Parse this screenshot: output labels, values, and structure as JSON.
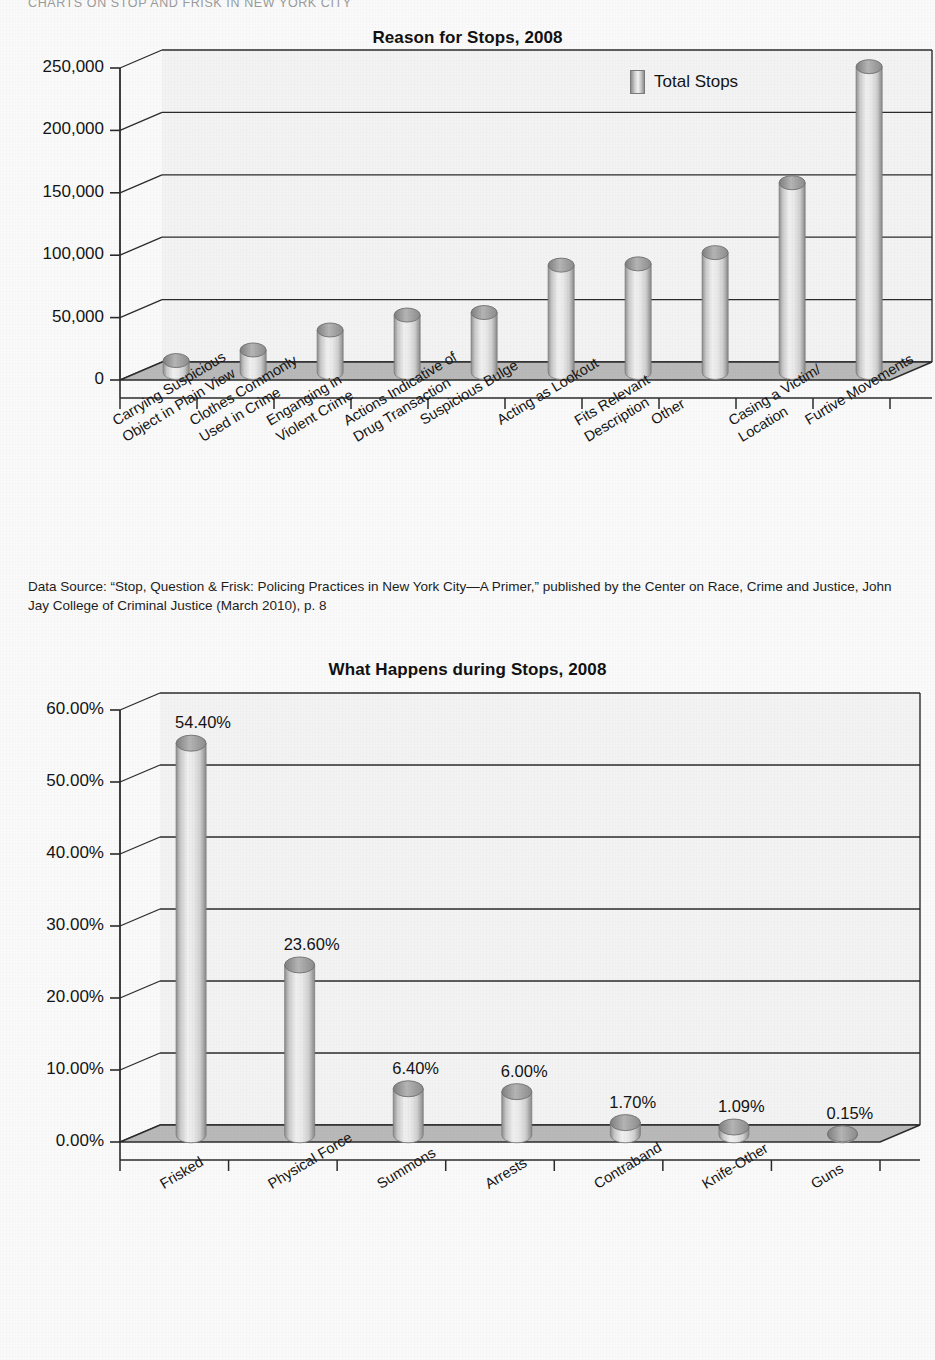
{
  "running_header": "CHARTS ON STOP AND FRISK IN NEW YORK CITY",
  "caption": {
    "text": "Data Source: “Stop, Question & Frisk: Policing Practices in New York City—A Primer,” published by the Center on Race, Crime and Justice, John Jay College of Criminal Justice (March 2010), p. 8"
  },
  "colors": {
    "bar_light": "#f0f0f0",
    "bar_mid": "#cfcfcf",
    "bar_dark": "#8f8f8f",
    "bar_top": "#a8a8a8",
    "floor": "#b9b9b9",
    "axis": "#2b2b2b",
    "text": "#141414",
    "page_bg": "#fafafa"
  },
  "chart_data": [
    {
      "id": "reason-for-stops",
      "type": "bar",
      "title": "Reason for Stops, 2008",
      "xlabel": "",
      "ylabel": "",
      "ylim": [
        0,
        250000
      ],
      "yticks": [
        0,
        50000,
        100000,
        150000,
        200000,
        250000
      ],
      "ytick_labels": [
        "0",
        "50,000",
        "100,000",
        "150,000",
        "200,000",
        "250,000"
      ],
      "grid": true,
      "legend": [
        "Total Stops"
      ],
      "legend_position": "top-right",
      "categories": [
        "Carrying Suspicious Object in Plain View",
        "Clothes Commonly Used in Crime",
        "Enganging in Violent Crime",
        "Actions Indicative of Drug Transaction",
        "Suspicious Bulge",
        "Acting as Lookout",
        "Fits Relevant Description",
        "Other",
        "Casing a Victim/ Location",
        "Furtive Movements"
      ],
      "category_lines": [
        [
          "Carrying Suspicious",
          "Object in Plain View"
        ],
        [
          "Clothes Commonly",
          "Used in Crime"
        ],
        [
          "Enganging in",
          "Violent Crime"
        ],
        [
          "Actions Indicative of",
          "Drug Transaction"
        ],
        [
          "Suspicious Bulge"
        ],
        [
          "Acting as Lookout"
        ],
        [
          "Fits Relevant",
          "Description"
        ],
        [
          "Other"
        ],
        [
          "Casing a Victim/",
          "Location"
        ],
        [
          "Furtive Movements"
        ]
      ],
      "series": [
        {
          "name": "Total Stops",
          "values": [
            9500,
            18000,
            34000,
            46000,
            48000,
            86000,
            87000,
            96000,
            152000,
            245000
          ]
        }
      ]
    },
    {
      "id": "what-happens-during-stops",
      "type": "bar",
      "title": "What Happens during Stops, 2008",
      "xlabel": "",
      "ylabel": "",
      "ylim": [
        0,
        60
      ],
      "yticks": [
        0,
        10,
        20,
        30,
        40,
        50,
        60
      ],
      "ytick_labels": [
        "0.00%",
        "10.00%",
        "20.00%",
        "30.00%",
        "40.00%",
        "50.00%",
        "60.00%"
      ],
      "grid": true,
      "legend": [],
      "categories": [
        "Frisked",
        "Physical Force",
        "Summons",
        "Arrests",
        "Contraband",
        "Knife-Other",
        "Guns"
      ],
      "category_lines": [
        [
          "Frisked"
        ],
        [
          "Physical Force"
        ],
        [
          "Summons"
        ],
        [
          "Arrests"
        ],
        [
          "Contraband"
        ],
        [
          "Knife-Other"
        ],
        [
          "Guns"
        ]
      ],
      "series": [
        {
          "name": "Percent",
          "values": [
            54.4,
            23.6,
            6.4,
            6.0,
            1.7,
            1.09,
            0.15
          ]
        }
      ],
      "data_labels": [
        "54.40%",
        "23.60%",
        "6.40%",
        "6.00%",
        "1.70%",
        "1.09%",
        "0.15%"
      ]
    }
  ]
}
